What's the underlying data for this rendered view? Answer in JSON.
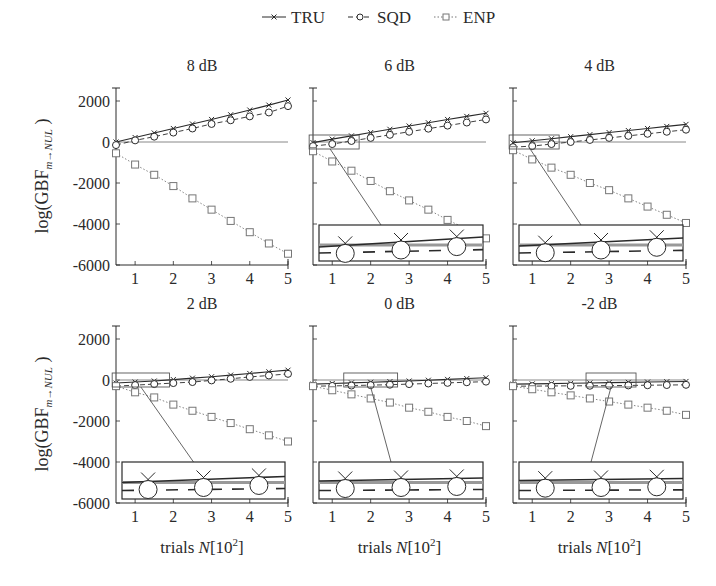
{
  "legend": {
    "entries": [
      {
        "label": "TRU",
        "marker": "x-cross",
        "line": "solid"
      },
      {
        "label": "SQD",
        "marker": "circle",
        "line": "dashed"
      },
      {
        "label": "ENP",
        "marker": "square",
        "line": "dotted"
      }
    ]
  },
  "axes": {
    "ylabel": "log(GBF",
    "ylabel_sub": "m→NUL",
    "ylabel_close": ")",
    "xlabel": "trials",
    "xlabel_var": "N",
    "xlabel_unit": "[10",
    "xlabel_exp": "2",
    "xlabel_close": "]",
    "xticks": [
      "1",
      "2",
      "3",
      "4",
      "5"
    ],
    "yticks": [
      "2000",
      "0",
      "-2000",
      "-4000",
      "-6000"
    ]
  },
  "chart_data": [
    {
      "type": "line",
      "title": "8 dB",
      "xlabel": "",
      "ylabel": "log(GBF m→NUL)",
      "xlim": [
        0.5,
        5
      ],
      "ylim": [
        -6000,
        2500
      ],
      "grid": false,
      "legend_position": "top",
      "x": [
        0.5,
        1,
        1.5,
        2,
        2.5,
        3,
        3.5,
        4,
        4.5,
        5
      ],
      "series": [
        {
          "name": "TRU",
          "values": [
            0,
            220,
            440,
            660,
            880,
            1100,
            1330,
            1560,
            1800,
            2050
          ]
        },
        {
          "name": "SQD",
          "values": [
            -150,
            80,
            260,
            460,
            660,
            880,
            1060,
            1250,
            1440,
            1750
          ]
        },
        {
          "name": "ENP",
          "values": [
            -550,
            -1100,
            -1600,
            -2150,
            -2750,
            -3300,
            -3850,
            -4400,
            -4950,
            -5450
          ]
        }
      ],
      "inset": false
    },
    {
      "type": "line",
      "title": "6 dB",
      "xlabel": "",
      "ylabel": "",
      "xlim": [
        0.5,
        5
      ],
      "ylim": [
        -6000,
        2500
      ],
      "grid": false,
      "x": [
        0.5,
        1,
        1.5,
        2,
        2.5,
        3,
        3.5,
        4,
        4.5,
        5
      ],
      "series": [
        {
          "name": "TRU",
          "values": [
            -30,
            140,
            300,
            460,
            620,
            780,
            940,
            1100,
            1250,
            1400
          ]
        },
        {
          "name": "SQD",
          "values": [
            -200,
            -100,
            50,
            200,
            350,
            500,
            650,
            800,
            950,
            1100
          ]
        },
        {
          "name": "ENP",
          "values": [
            -450,
            -950,
            -1400,
            -1900,
            -2400,
            -2850,
            -3300,
            -3800,
            -4250,
            -4700
          ]
        }
      ],
      "inset": true
    },
    {
      "type": "line",
      "title": "4 dB",
      "xlabel": "",
      "ylabel": "",
      "xlim": [
        0.5,
        5
      ],
      "ylim": [
        -6000,
        2500
      ],
      "grid": false,
      "x": [
        0.5,
        1,
        1.5,
        2,
        2.5,
        3,
        3.5,
        4,
        4.5,
        5
      ],
      "series": [
        {
          "name": "TRU",
          "values": [
            -40,
            60,
            160,
            260,
            360,
            460,
            560,
            660,
            760,
            860
          ]
        },
        {
          "name": "SQD",
          "values": [
            -250,
            -200,
            -100,
            0,
            100,
            200,
            300,
            400,
            500,
            600
          ]
        },
        {
          "name": "ENP",
          "values": [
            -400,
            -850,
            -1250,
            -1600,
            -2000,
            -2350,
            -2750,
            -3150,
            -3550,
            -3950
          ]
        }
      ],
      "inset": true
    },
    {
      "type": "line",
      "title": "2 dB",
      "xlabel": "trials N[10^2]",
      "ylabel": "log(GBF m→NUL)",
      "xlim": [
        0.5,
        5
      ],
      "ylim": [
        -6000,
        2500
      ],
      "grid": false,
      "x": [
        0.5,
        1,
        1.5,
        2,
        2.5,
        3,
        3.5,
        4,
        4.5,
        5
      ],
      "series": [
        {
          "name": "TRU",
          "values": [
            -150,
            -100,
            -50,
            20,
            90,
            160,
            240,
            320,
            400,
            480
          ]
        },
        {
          "name": "SQD",
          "values": [
            -300,
            -250,
            -200,
            -150,
            -100,
            -20,
            60,
            150,
            220,
            300
          ]
        },
        {
          "name": "ENP",
          "values": [
            -300,
            -600,
            -850,
            -1200,
            -1500,
            -1800,
            -2100,
            -2400,
            -2700,
            -3000
          ]
        }
      ],
      "inset": true
    },
    {
      "type": "line",
      "title": "0 dB",
      "xlabel": "trials N[10^2]",
      "ylabel": "",
      "xlim": [
        0.5,
        5
      ],
      "ylim": [
        -6000,
        2500
      ],
      "grid": false,
      "x": [
        0.5,
        1,
        1.5,
        2,
        2.5,
        3,
        3.5,
        4,
        4.5,
        5
      ],
      "series": [
        {
          "name": "TRU",
          "values": [
            -200,
            -170,
            -140,
            -110,
            -80,
            -50,
            -10,
            30,
            70,
            110
          ]
        },
        {
          "name": "SQD",
          "values": [
            -300,
            -290,
            -270,
            -250,
            -230,
            -200,
            -170,
            -140,
            -110,
            -80
          ]
        },
        {
          "name": "ENP",
          "values": [
            -300,
            -500,
            -700,
            -900,
            -1100,
            -1350,
            -1550,
            -1800,
            -2000,
            -2250
          ]
        }
      ],
      "inset": true
    },
    {
      "type": "line",
      "title": "-2 dB",
      "xlabel": "trials N[10^2]",
      "ylabel": "",
      "xlim": [
        0.5,
        5
      ],
      "ylim": [
        -6000,
        2500
      ],
      "grid": false,
      "x": [
        0.5,
        1,
        1.5,
        2,
        2.5,
        3,
        3.5,
        4,
        4.5,
        5
      ],
      "series": [
        {
          "name": "TRU",
          "values": [
            -200,
            -190,
            -175,
            -160,
            -145,
            -130,
            -115,
            -100,
            -85,
            -70
          ]
        },
        {
          "name": "SQD",
          "values": [
            -300,
            -300,
            -290,
            -285,
            -280,
            -275,
            -265,
            -255,
            -245,
            -235
          ]
        },
        {
          "name": "ENP",
          "values": [
            -300,
            -450,
            -600,
            -750,
            -900,
            -1050,
            -1200,
            -1350,
            -1500,
            -1700
          ]
        }
      ],
      "inset": true
    }
  ]
}
